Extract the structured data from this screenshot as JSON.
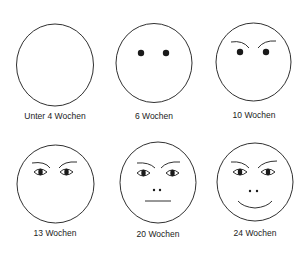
{
  "figure": {
    "stroke_color": "#1a1a1a",
    "background": "#ffffff",
    "faces": [
      {
        "label": "Unter 4 Wochen",
        "features": []
      },
      {
        "label": "6 Wochen",
        "features": [
          "eyes-dots"
        ]
      },
      {
        "label": "10 Wochen",
        "features": [
          "eyebrows",
          "eyes-dots"
        ]
      },
      {
        "label": "13 Wochen",
        "features": [
          "eyebrows",
          "eyes-almond"
        ]
      },
      {
        "label": "20 Wochen",
        "features": [
          "eyebrows",
          "eyes-almond",
          "nostrils",
          "mouth-straight"
        ]
      },
      {
        "label": "24 Wochen",
        "features": [
          "eyebrows",
          "eyes-almond",
          "nostrils",
          "mouth-smile"
        ]
      }
    ]
  }
}
